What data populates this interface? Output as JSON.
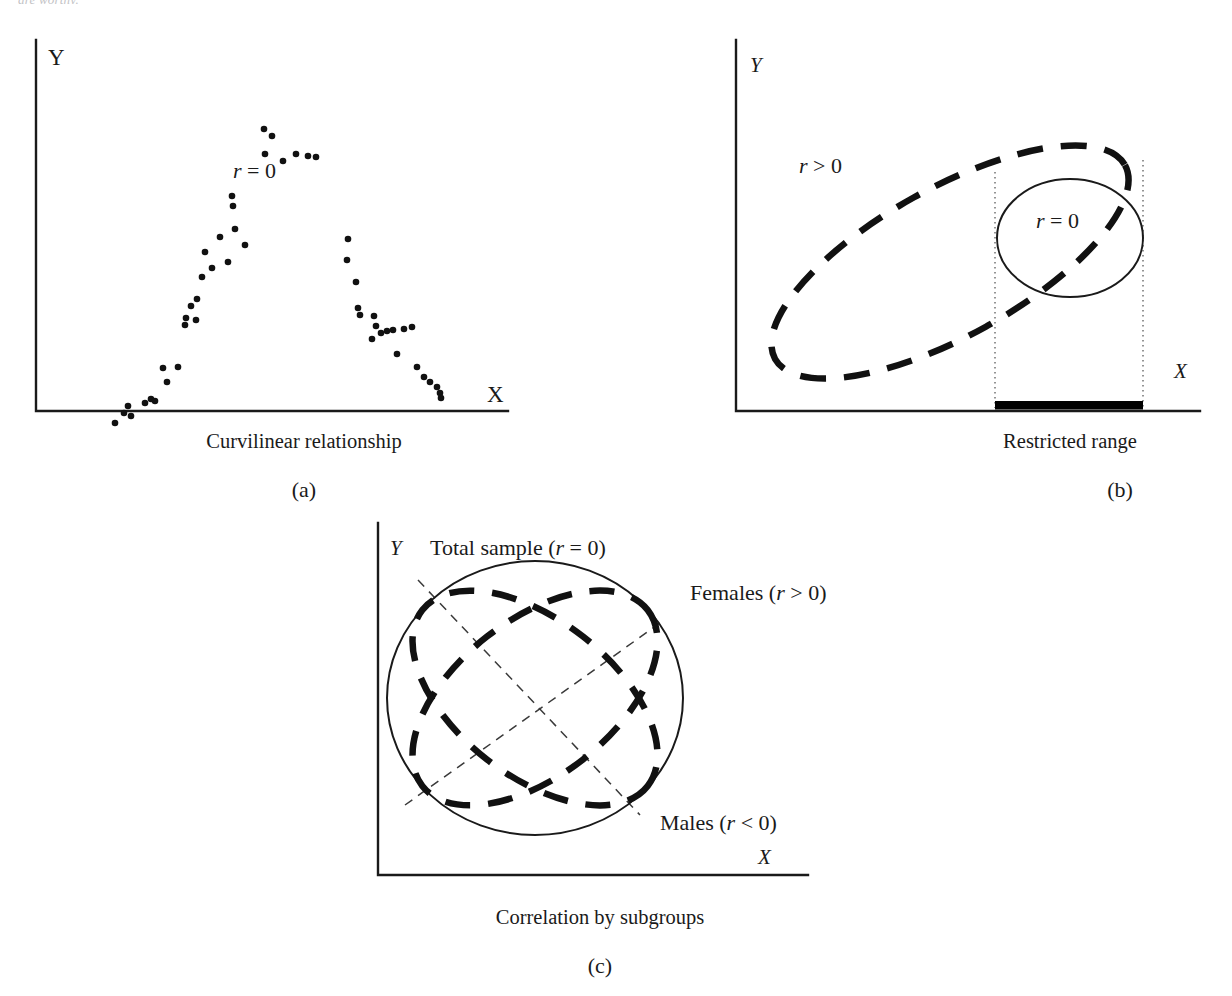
{
  "figure": {
    "clipped_header_text": "are worthy.",
    "background_color": "#ffffff",
    "ink_color": "#1a1a1a"
  },
  "panels": [
    {
      "id": "a",
      "letter": "(a)",
      "caption": "Curvilinear relationship",
      "y_axis_label": "Y",
      "x_axis_label": "X",
      "annotation": "r = 0",
      "annotation_parts": {
        "symbol": "r",
        "relation": "=",
        "value": "0"
      }
    },
    {
      "id": "b",
      "letter": "(b)",
      "caption": "Restricted range",
      "y_axis_label": "Y",
      "x_axis_label": "X",
      "full_range_label": "r > 0",
      "restricted_label": "r = 0"
    },
    {
      "id": "c",
      "letter": "(c)",
      "caption": "Correlation by subgroups",
      "y_axis_label": "Y",
      "x_axis_label": "X",
      "total_label": "Total sample (r = 0)",
      "females_label": "Females (r > 0)",
      "males_label": "Males (r < 0)"
    }
  ],
  "chart_data": [
    {
      "type": "scatter",
      "panel": "a",
      "title": "Curvilinear relationship",
      "xlabel": "X",
      "ylabel": "Y",
      "annotation": "r = 0",
      "grid": false,
      "legend": "none",
      "xlim": [
        0,
        500
      ],
      "ylim": [
        0,
        400
      ],
      "note": "Inverted-U (curvilinear) cloud of points; Pearson r = 0 despite strong relationship",
      "points": [
        [
          115,
          393
        ],
        [
          124,
          383
        ],
        [
          128,
          376
        ],
        [
          131,
          386
        ],
        [
          145,
          373
        ],
        [
          151,
          369
        ],
        [
          155,
          371
        ],
        [
          163,
          338
        ],
        [
          178,
          337
        ],
        [
          167,
          352
        ],
        [
          185,
          295
        ],
        [
          186,
          288
        ],
        [
          196,
          290
        ],
        [
          191,
          276
        ],
        [
          197,
          269
        ],
        [
          202,
          247
        ],
        [
          205,
          222
        ],
        [
          212,
          238
        ],
        [
          228,
          232
        ],
        [
          220,
          207
        ],
        [
          235,
          199
        ],
        [
          232,
          166
        ],
        [
          233,
          176
        ],
        [
          245,
          215
        ],
        [
          264,
          99
        ],
        [
          272,
          106
        ],
        [
          265,
          124
        ],
        [
          283,
          131
        ],
        [
          296,
          124
        ],
        [
          308,
          126
        ],
        [
          316,
          127
        ],
        [
          348,
          209
        ],
        [
          347,
          230
        ],
        [
          356,
          252
        ],
        [
          358,
          278
        ],
        [
          360,
          285
        ],
        [
          374,
          286
        ],
        [
          376,
          296
        ],
        [
          372,
          309
        ],
        [
          381,
          303
        ],
        [
          387,
          301
        ],
        [
          393,
          300
        ],
        [
          404,
          299
        ],
        [
          412,
          297
        ],
        [
          397,
          324
        ],
        [
          417,
          337
        ],
        [
          424,
          347
        ],
        [
          430,
          352
        ],
        [
          437,
          357
        ],
        [
          440,
          363
        ],
        [
          441,
          368
        ]
      ]
    },
    {
      "type": "diagram",
      "panel": "b",
      "title": "Restricted range",
      "xlabel": "X",
      "ylabel": "Y",
      "shapes": [
        {
          "name": "full-sample-ellipse",
          "style": "dashed",
          "label": "r > 0",
          "orientation_deg": -29
        },
        {
          "name": "restricted-ellipse",
          "style": "solid",
          "label": "r = 0"
        },
        {
          "name": "restriction-bounds",
          "style": "dotted-vertical-lines"
        },
        {
          "name": "restricted-range-bar",
          "style": "thick-solid-bar"
        }
      ]
    },
    {
      "type": "diagram",
      "panel": "c",
      "title": "Correlation by subgroups",
      "xlabel": "X",
      "ylabel": "Y",
      "shapes": [
        {
          "name": "total-sample-ellipse",
          "style": "solid",
          "label": "Total sample (r = 0)"
        },
        {
          "name": "females-ellipse",
          "style": "dashed",
          "label": "Females (r > 0)",
          "orientation_deg": -38
        },
        {
          "name": "males-ellipse",
          "style": "dashed",
          "label": "Males (r < 0)",
          "orientation_deg": 38
        },
        {
          "name": "females-trend-line",
          "style": "thin-dashed"
        },
        {
          "name": "males-trend-line",
          "style": "thin-dashed"
        }
      ]
    }
  ]
}
